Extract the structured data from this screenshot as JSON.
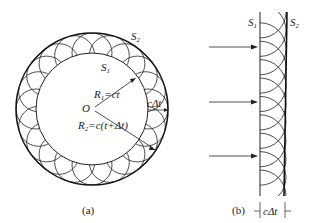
{
  "figure_a": {
    "caption": "(a)",
    "outer_label": "S",
    "outer_sub": "2",
    "inner_label": "S",
    "inner_sub": "1",
    "center_label": "O",
    "r1_label": "R",
    "r1_sub": "1",
    "r1_eq": "=ct",
    "r2_label": "R",
    "r2_sub": "2",
    "r2_eq": "=c(t+Δt)",
    "gap_label": "cΔt",
    "wavelet_count": 20
  },
  "figure_b": {
    "caption": "(b)",
    "left_label": "S",
    "left_sub": "1",
    "right_label": "S",
    "right_sub": "2",
    "gap_label": "cΔt",
    "arrow_count": 3,
    "wavelet_count": 10
  }
}
